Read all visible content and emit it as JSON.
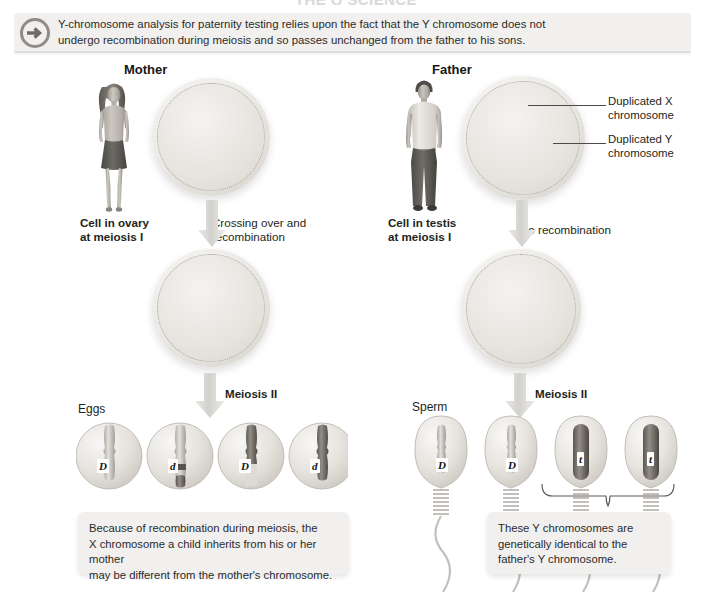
{
  "figure": {
    "title_sliver": "THE Q SCIENCE",
    "banner": {
      "icon": "arrow-circle-right-icon",
      "line1": "Y-chromosome analysis for paternity testing relies upon the fact that the Y chromosome does not",
      "line2": "undergo recombination during meiosis and so passes unchanged from the father to his sons."
    },
    "columns": {
      "mother": {
        "heading": "Mother",
        "person_icon": "woman-standing-figure",
        "cell_label_line1": "Cell in ovary",
        "cell_label_line2": "at meiosis I",
        "process_label_line1": "Crossing over and",
        "process_label_line2": "recombination",
        "meiosis2_label": "Meiosis II",
        "gamete_label": "Eggs",
        "cell1_alleles": [
          "D",
          "d",
          "D",
          "d"
        ],
        "cell2_alleles": [
          "D",
          "d",
          "D",
          "d"
        ],
        "gamete_alleles": [
          "D",
          "d",
          "D",
          "d"
        ],
        "caption": {
          "line1": "Because of recombination during meiosis, the",
          "line2": "X chromosome a child inherits from his or her mother",
          "line3": "may be different from the mother's chromosome."
        }
      },
      "father": {
        "heading": "Father",
        "person_icon": "man-standing-figure",
        "cell_label_line1": "Cell in testis",
        "cell_label_line2": "at meiosis I",
        "process_label_line1": "No recombination",
        "process_label_line2": "",
        "meiosis2_label": "Meiosis II",
        "gamete_label": "Sperm",
        "cell1_alleles": [
          "D",
          "D",
          "t",
          "t"
        ],
        "cell2_alleles": [
          "D",
          "D",
          "t",
          "t"
        ],
        "gamete_alleles": [
          "D",
          "D",
          "t",
          "t"
        ],
        "callout_x": "Duplicated X chromosome",
        "callout_y": "Duplicated Y chromosome",
        "caption": {
          "line1": "These Y chromosomes are",
          "line2": "genetically identical to the",
          "line3": "father's Y chromosome."
        }
      }
    },
    "colors": {
      "banner_bg": "#f1f0ee",
      "text": "#231f20",
      "chromosome_light": "#cfcbc4",
      "chromosome_dark": "#6f6b66",
      "arrow_grey": "#d6d4d0"
    }
  }
}
